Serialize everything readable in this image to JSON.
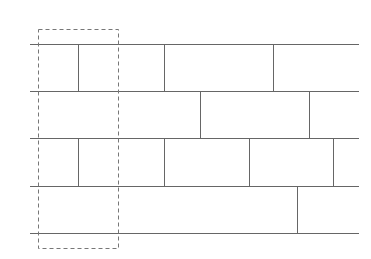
{
  "diagram": {
    "type": "brick-pattern",
    "colors": {
      "background": "#ffffff",
      "line": "#666666",
      "selection": "#777777"
    },
    "line_x_start": 30,
    "line_x_end": 359,
    "rows_y": [
      44,
      91,
      138,
      186,
      233
    ],
    "rows": [
      {
        "top": 44,
        "bottom": 91,
        "dividers": [
          78,
          164,
          273
        ]
      },
      {
        "top": 91,
        "bottom": 138,
        "dividers": [
          200,
          309
        ]
      },
      {
        "top": 138,
        "bottom": 186,
        "dividers": [
          78,
          164,
          249,
          333
        ]
      },
      {
        "top": 186,
        "bottom": 233,
        "dividers": [
          297
        ]
      }
    ],
    "selection_box": {
      "x": 38,
      "y": 29,
      "width": 80,
      "height": 219,
      "style": "dashed"
    }
  }
}
